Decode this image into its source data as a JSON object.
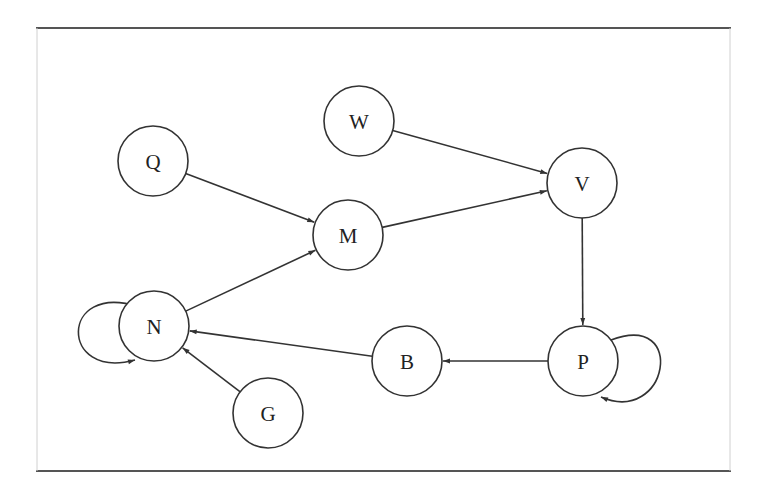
{
  "diagram": {
    "type": "directed-graph",
    "frame": {
      "x1": 36,
      "y1": 28,
      "x2": 731,
      "y2": 471
    },
    "node_radius": 35,
    "nodes": [
      {
        "id": "W",
        "label": "W",
        "x": 359,
        "y": 121
      },
      {
        "id": "Q",
        "label": "Q",
        "x": 153,
        "y": 161
      },
      {
        "id": "V",
        "label": "V",
        "x": 582,
        "y": 183
      },
      {
        "id": "M",
        "label": "M",
        "x": 348,
        "y": 235
      },
      {
        "id": "N",
        "label": "N",
        "x": 154,
        "y": 326
      },
      {
        "id": "B",
        "label": "B",
        "x": 407,
        "y": 361
      },
      {
        "id": "P",
        "label": "P",
        "x": 583,
        "y": 361
      },
      {
        "id": "G",
        "label": "G",
        "x": 268,
        "y": 413
      }
    ],
    "edges": [
      {
        "from": "Q",
        "to": "M"
      },
      {
        "from": "W",
        "to": "V"
      },
      {
        "from": "M",
        "to": "V"
      },
      {
        "from": "V",
        "to": "P"
      },
      {
        "from": "P",
        "to": "B"
      },
      {
        "from": "B",
        "to": "N"
      },
      {
        "from": "N",
        "to": "M"
      },
      {
        "from": "G",
        "to": "N"
      },
      {
        "from": "N",
        "to": "N"
      },
      {
        "from": "P",
        "to": "P"
      }
    ]
  }
}
